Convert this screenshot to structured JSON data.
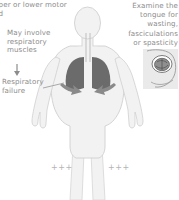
{
  "figure": {
    "background_color": "#ffffff",
    "text_color": "#8c8c8c"
  },
  "annotations": {
    "upper_lower_motor": "pper or lower motor\ned",
    "respiratory_muscles": "May involve\nrespiratory\nmuscles",
    "respiratory_failure": "Respiratory\nfailure",
    "tongue_exam": "Examine the\ntongue for\nwasting,\nfasciculations\nor spasticity"
  },
  "markers": {
    "left_reflex": "+++",
    "right_reflex": "+++",
    "marker_color": "#b4b4b4"
  },
  "icons": {
    "down_arrow": "down-arrow-icon",
    "leader_line": "leader-line-icon",
    "diaphragm_arrows": "diaphragm-arrow-icon"
  },
  "colors": {
    "body_fill": "#f2f2f2",
    "body_stroke": "#cfcfcf",
    "lung_fill": "#6b6b6b",
    "arrow_fill": "#8a8a8a",
    "inset_fill": "#eaeaea",
    "inset_stroke": "#bdbdbd"
  }
}
